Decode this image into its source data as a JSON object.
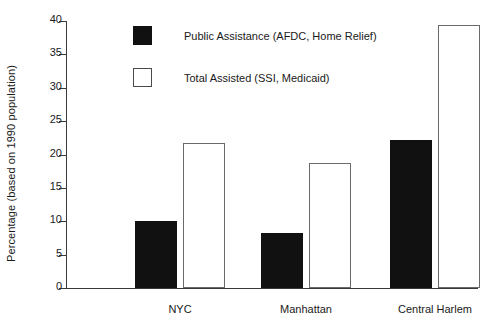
{
  "chart_data": {
    "type": "bar",
    "title": "",
    "xlabel": "",
    "ylabel": "Percentage (based on 1990 population)",
    "categories": [
      "NYC",
      "Manhattan",
      "Central Harlem"
    ],
    "series": [
      {
        "name": "Public Assistance (AFDC, Home Relief)",
        "style": "solid-black",
        "color": "#111111",
        "values": [
          10.0,
          8.3,
          22.1
        ]
      },
      {
        "name": "Total Assisted (SSI, Medicaid)",
        "style": "hollow-white",
        "color": "#ffffff",
        "values": [
          21.7,
          18.7,
          39.4
        ]
      }
    ],
    "ylim": [
      0,
      40
    ],
    "yticks": [
      0,
      5,
      10,
      15,
      20,
      25,
      30,
      35,
      40
    ],
    "ytick_labels": [
      "0",
      "5",
      "10",
      "15",
      "20",
      "25",
      "30",
      "35",
      "40"
    ],
    "grid": false,
    "legend_position": "upper-left-inside"
  },
  "axis": {
    "y_title": "Percentage (based on 1990 population)",
    "tick_labels": [
      "40",
      "35",
      "30",
      "25",
      "20",
      "15",
      "10",
      "5",
      "0"
    ],
    "category_labels": [
      "NYC",
      "Manhattan",
      "Central Harlem"
    ]
  },
  "legend": {
    "entries": [
      {
        "label": "Public Assistance (AFDC, Home Relief)",
        "swatch": "solid"
      },
      {
        "label": "Total Assisted (SSI, Medicaid)",
        "swatch": "hollow"
      }
    ]
  },
  "colors": {
    "series_solid": "#111111",
    "series_hollow_fill": "#ffffff",
    "series_hollow_stroke": "#6a6a6a",
    "axis": "#3a3a3a",
    "text": "#1a1a1a",
    "background": "#ffffff"
  }
}
